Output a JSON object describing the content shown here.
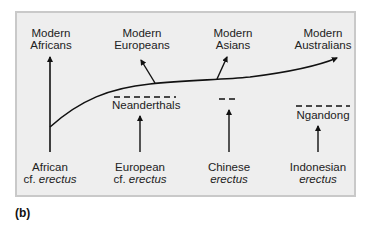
{
  "figure_label": "(b)",
  "colors": {
    "panel_background": "#eeeeee",
    "panel_border": "#c9c9c9",
    "line": "#111111"
  },
  "top_labels": [
    {
      "line1": "Modern",
      "line2": "Africans"
    },
    {
      "line1": "Modern",
      "line2": "Europeans"
    },
    {
      "line1": "Modern",
      "line2": "Asians"
    },
    {
      "line1": "Modern",
      "line2": "Australians"
    }
  ],
  "intermediate_labels": [
    {
      "text": "Neanderthals"
    },
    {
      "text": ""
    },
    {
      "text": "Ngandong"
    }
  ],
  "bottom_labels": [
    {
      "line1": "African",
      "prefix": "cf. ",
      "species": "erectus"
    },
    {
      "line1": "European",
      "prefix": "cf. ",
      "species": "erectus"
    },
    {
      "line1": "Chinese",
      "prefix": "",
      "species": "erectus"
    },
    {
      "line1": "Indonesian",
      "prefix": "",
      "species": "erectus"
    }
  ]
}
